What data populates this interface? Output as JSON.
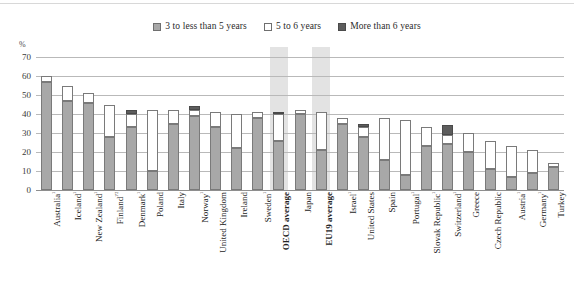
{
  "axis": {
    "unit_label": "%",
    "ticks": [
      70,
      60,
      50,
      40,
      30,
      20,
      10,
      0
    ]
  },
  "legend": {
    "items": [
      {
        "label": "3 to less than 5 years",
        "swatch": "legend-swatch-gray",
        "color": "#a8a8a8"
      },
      {
        "label": "5 to 6 years",
        "swatch": "legend-swatch-white",
        "color": "#ffffff"
      },
      {
        "label": "More than 6 years",
        "swatch": "legend-swatch-dark",
        "color": "#5d5d5d"
      }
    ]
  },
  "chart_data": {
    "type": "bar",
    "title": "",
    "xlabel": "",
    "ylabel": "%",
    "ylim": [
      0,
      70
    ],
    "grid": true,
    "legend_position": "top-center",
    "stacked": true,
    "categories": [
      "Australia¹",
      "Iceland¹",
      "New Zealand¹",
      "Finland¹'²",
      "Denmark¹",
      "Poland",
      "Italy",
      "Norway¹",
      "United Kingdom",
      "Ireland",
      "Sweden¹",
      "OECD average",
      "Japan",
      "EU19 average",
      "Israel¹",
      "United States",
      "Spain",
      "Portugal¹",
      "Slovak Republic¹",
      "Switzerland¹",
      "Greece",
      "Czech Republic",
      "Austria¹",
      "Germany¹",
      "Turkey"
    ],
    "series": [
      {
        "name": "3 to less than 5 years",
        "color": "#a8a8a8",
        "values": [
          57,
          47,
          46,
          28,
          33,
          10,
          35,
          39,
          33,
          22,
          38,
          26,
          40,
          21,
          35,
          28,
          16,
          8,
          23,
          24,
          20,
          11,
          7,
          9,
          12
        ]
      },
      {
        "name": "5 to 6 years",
        "color": "#ffffff",
        "values": [
          3,
          8,
          5,
          17,
          7,
          32,
          7,
          3,
          8,
          18,
          3,
          14,
          2,
          20,
          3,
          5,
          22,
          29,
          10,
          5,
          10,
          15,
          16,
          12,
          2
        ]
      },
      {
        "name": "More than 6 years",
        "color": "#5d5d5d",
        "values": [
          0,
          0,
          0,
          0,
          2,
          0,
          0,
          2,
          0,
          0,
          0,
          1,
          0,
          0,
          0,
          2,
          0,
          0,
          0,
          5,
          0,
          0,
          0,
          0,
          0
        ]
      }
    ],
    "totals": [
      60,
      55,
      51,
      45,
      42,
      42,
      42,
      44,
      41,
      40,
      41,
      41,
      42,
      41,
      38,
      35,
      38,
      37,
      33,
      34,
      30,
      26,
      23,
      21,
      14
    ],
    "highlighted_categories": [
      "OECD average",
      "EU19 average"
    ],
    "highlight_color": "#e3e3e3"
  }
}
